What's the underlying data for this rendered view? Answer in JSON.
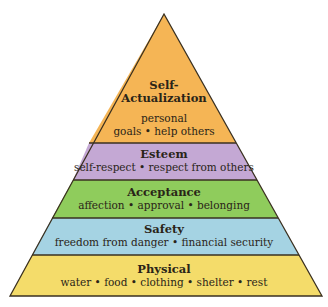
{
  "diagram": {
    "type": "pyramid",
    "outline_color": "#3a3020",
    "layers": [
      {
        "title": "Self-\nActualization",
        "title_line1": "Self-",
        "title_line2": "Actualization",
        "subtitle_line1": "personal",
        "subtitle_line2": "goals • help others",
        "color": "#f5b555"
      },
      {
        "title": "Esteem",
        "subtitle": "self-respect • respect from others",
        "color": "#c4a8d4"
      },
      {
        "title": "Acceptance",
        "subtitle": "affection • approval • belonging",
        "color": "#8fcc5c"
      },
      {
        "title": "Safety",
        "subtitle": "freedom from danger • financial security",
        "color": "#a5d3e3"
      },
      {
        "title": "Physical",
        "subtitle": "water • food • clothing • shelter • rest",
        "color": "#f4dc6a"
      }
    ]
  }
}
